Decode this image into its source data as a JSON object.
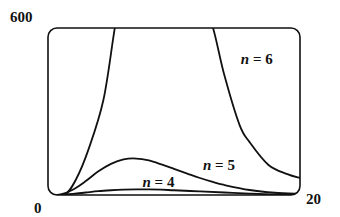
{
  "chart_data": {
    "type": "line",
    "title": "",
    "xlabel": "",
    "ylabel": "",
    "xlim": [
      0,
      20
    ],
    "ylim": [
      0,
      600
    ],
    "grid": false,
    "legend": "none",
    "x_ticks": [
      "0",
      "20"
    ],
    "y_ticks": [
      "600"
    ],
    "series": [
      {
        "name": "n = 4",
        "label": "n = 4",
        "label_anchor": {
          "x": 7.5,
          "y": 30
        },
        "x": [
          0,
          1,
          2,
          3,
          4,
          5,
          6,
          7,
          8,
          9,
          10,
          12,
          14,
          16,
          18,
          20
        ],
        "values": [
          0,
          0.5,
          4,
          9,
          14,
          17,
          19,
          20,
          20,
          19,
          17,
          13,
          9,
          5,
          2,
          1
        ]
      },
      {
        "name": "n = 5",
        "label": "n = 5",
        "label_anchor": {
          "x": 12.3,
          "y": 90
        },
        "x": [
          0,
          1,
          2,
          3,
          4,
          5,
          6,
          7,
          8,
          9,
          10,
          11,
          12,
          13,
          14,
          16,
          18,
          20
        ],
        "values": [
          0,
          2,
          20,
          50,
          85,
          112,
          128,
          131,
          124,
          110,
          94,
          78,
          62,
          48,
          36,
          18,
          8,
          4
        ]
      },
      {
        "name": "n = 6",
        "label": "n = 6",
        "label_anchor": {
          "x": 15.3,
          "y": 470
        },
        "x": [
          0,
          1.3,
          2.2,
          3.2,
          4.4,
          5.3,
          6,
          8,
          10,
          12,
          13.1,
          14,
          15.2,
          16,
          17.5,
          19,
          20
        ],
        "values": [
          0,
          0,
          54,
          162,
          342,
          600,
          780,
          1000,
          950,
          750,
          600,
          430,
          252,
          190,
          108,
          75,
          61
        ]
      }
    ]
  }
}
